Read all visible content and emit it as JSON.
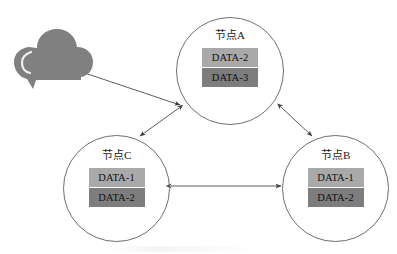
{
  "diagram": {
    "colors": {
      "data_light": "#a9a9a9",
      "data_dark": "#7d7d7d",
      "cloud_fill": "#808080",
      "circle_stroke": "#6f6f6f",
      "arrow_stroke": "#4a4a4a",
      "background": "#ffffff",
      "text": "#111111"
    },
    "cloud": {
      "icon": "cloud-icon",
      "label": ""
    },
    "nodes": [
      {
        "id": "node-a",
        "label": "节点A",
        "data_items": [
          {
            "label": "DATA-2",
            "shade": "light"
          },
          {
            "label": "DATA-3",
            "shade": "dark"
          }
        ]
      },
      {
        "id": "node-c",
        "label": "节点C",
        "data_items": [
          {
            "label": "DATA-1",
            "shade": "light"
          },
          {
            "label": "DATA-2",
            "shade": "dark"
          }
        ]
      },
      {
        "id": "node-b",
        "label": "节点B",
        "data_items": [
          {
            "label": "DATA-1",
            "shade": "light"
          },
          {
            "label": "DATA-2",
            "shade": "dark"
          }
        ]
      }
    ],
    "connections": [
      {
        "from": "cloud",
        "to": "node-a",
        "arrow": "single"
      },
      {
        "from": "node-a",
        "to": "node-c",
        "arrow": "double"
      },
      {
        "from": "node-a",
        "to": "node-b",
        "arrow": "double"
      },
      {
        "from": "node-c",
        "to": "node-b",
        "arrow": "double"
      }
    ]
  }
}
